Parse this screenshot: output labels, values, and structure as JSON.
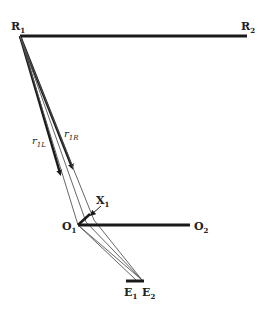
{
  "diagram": {
    "labels": {
      "R1": {
        "main": "R",
        "sub": "1"
      },
      "R2": {
        "main": "R",
        "sub": "2"
      },
      "O1": {
        "main": "O",
        "sub": "1"
      },
      "O2": {
        "main": "O",
        "sub": "2"
      },
      "X1": {
        "main": "X",
        "sub": "1"
      },
      "E1": {
        "main": "E",
        "sub": "1"
      },
      "E2": {
        "main": "E",
        "sub": "2"
      },
      "r1L": {
        "main": "r",
        "sub": "1L"
      },
      "r1R": {
        "main": "r",
        "sub": "1R"
      }
    },
    "colors": {
      "line": "#1a1a1a",
      "thin_line": "#555555",
      "background": "#ffffff"
    }
  }
}
